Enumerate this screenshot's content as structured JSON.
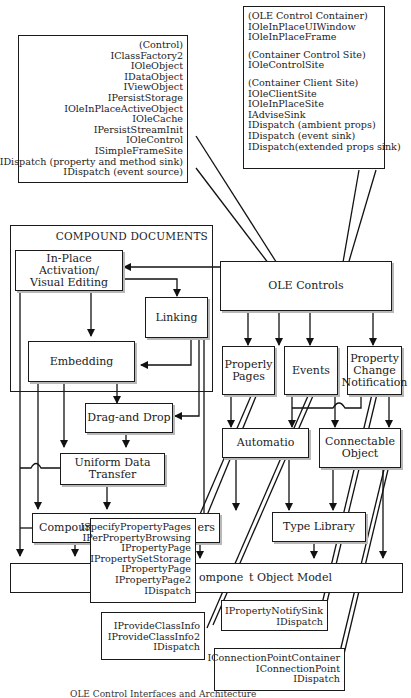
{
  "diagram": {
    "compound_documents_label": "COMPOUND DOCUMENTS",
    "nodes": {
      "inplace": "In-Place Activation/ Visual Editing",
      "inplace_line1": "In-Place Activation/",
      "inplace_line2": "Visual Editing",
      "linking": "Linking",
      "embedding": "Embedding",
      "drag_drop": "Drag-and Drop",
      "udt": "Uniform Data Transfer",
      "compound_files": "Compound",
      "persistent_tail": "ers",
      "com": "Component Object Model",
      "com_visible_left": "ompone",
      "com_visible_right": "t Object Model",
      "ole_controls": "OLE Controls",
      "property_pages_line1": "Properly",
      "property_pages_line2": "Pages",
      "events": "Events",
      "pcn_line1": "Property",
      "pcn_line2": "Change",
      "pcn_line3": "Notification",
      "automation": "Automatio",
      "connectable_line1": "Connectable",
      "connectable_line2": "Object",
      "type_library": "Type Library"
    },
    "callouts": {
      "control": [
        "(Control)",
        "IClassFactory2",
        "IOleObject",
        "IDataObject",
        "IViewObject",
        "IPersistStorage",
        "IOleInPlaceActiveObject",
        "IOleCache",
        "IPersistStreamInit",
        "IOleControl",
        "ISimpleFrameSite",
        "IDispatch (property and method sink)",
        "IDispatch (event source)"
      ],
      "container": [
        "(OLE Control Container)",
        "IOleInPlaceUIWindow",
        "IOleInPlaceFrame",
        "",
        "(Container Control Site)",
        "IOleControlSite",
        "",
        "(Container Client Site)",
        "IOleClientSite",
        "IOleInPlaceSite",
        "IAdviseSink",
        "IDispatch (ambient props)",
        "IDispatch (event sink)",
        "IDispatch(extended props sink)"
      ],
      "property_pages": [
        "ISpecifyPropertyPages",
        "IPerPropertyBrowsing",
        "IPropertyPage",
        "IPropertySetStorage",
        "IPropertyPage",
        "IPropertyPage2",
        "IDispatch"
      ],
      "events": [
        "IProvideClassInfo",
        "IProvideClassInfo2",
        "IDispatch"
      ],
      "property_notify": [
        "IPropertyNotifySink",
        "IDispatch"
      ],
      "connection_point": [
        "IConnectionPointContainer",
        "IConnectionPoint",
        "IDispatch"
      ]
    },
    "caption": "OLE Control Interfaces and Architecture"
  }
}
